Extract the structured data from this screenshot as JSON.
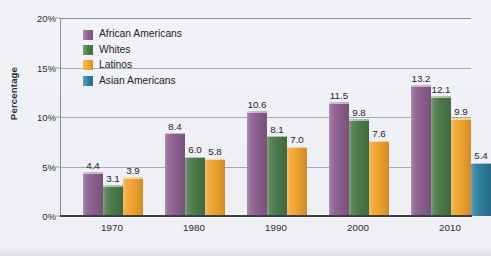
{
  "chart_data": {
    "type": "bar",
    "title": "",
    "subtitle": "",
    "xlabel": "",
    "ylabel": "Percentage",
    "categories": [
      "1970",
      "1980",
      "1990",
      "2000",
      "2010"
    ],
    "ylim": [
      0,
      20
    ],
    "ytick_values": [
      0,
      5,
      10,
      15,
      20
    ],
    "ytick_labels": [
      "0%",
      "5%",
      "10%",
      "15%",
      "20%"
    ],
    "grid": true,
    "grid_axis": "y",
    "legend_position": "upper-left-inside",
    "value_labels": true,
    "series": [
      {
        "name": "African Americans",
        "color": "#8c5f8f",
        "values": [
          4.4,
          8.4,
          10.6,
          11.5,
          13.2
        ],
        "labels": [
          "4.4",
          "8.4",
          "10.6",
          "11.5",
          "13.2"
        ]
      },
      {
        "name": "Whites",
        "color": "#4b7a4b",
        "values": [
          3.1,
          6.0,
          8.1,
          9.8,
          12.1
        ],
        "labels": [
          "3.1",
          "6.0",
          "8.1",
          "9.8",
          "12.1"
        ]
      },
      {
        "name": "Latinos",
        "color": "#f0a330",
        "values": [
          3.9,
          5.8,
          7.0,
          7.6,
          9.9
        ],
        "labels": [
          "3.9",
          "5.8",
          "7.0",
          "7.6",
          "9.9"
        ]
      },
      {
        "name": "Asian Americans",
        "color": "#2f7e9e",
        "values": [
          null,
          null,
          null,
          null,
          5.4
        ],
        "labels": [
          "",
          "",
          "",
          "",
          "5.4"
        ]
      }
    ]
  },
  "legend": {
    "items": [
      {
        "label": "African Americans",
        "color": "#8c5f8f"
      },
      {
        "label": "Whites",
        "color": "#4b7a4b"
      },
      {
        "label": "Latinos",
        "color": "#f0a330"
      },
      {
        "label": "Asian Americans",
        "color": "#2f7e9e"
      }
    ]
  },
  "axes": {
    "y_title": "Percentage",
    "y_ticks": [
      "20%",
      "15%",
      "10%",
      "5%",
      "0%"
    ],
    "x_ticks": [
      "1970",
      "1980",
      "1990",
      "2000",
      "2010"
    ]
  }
}
